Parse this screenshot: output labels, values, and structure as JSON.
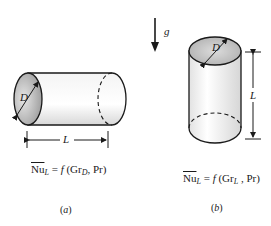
{
  "figure": {
    "panel_a": {
      "description": "Horizontal cylinder",
      "labels": {
        "diameter": "D",
        "length": "L"
      },
      "equation": {
        "lhs_base": "Nu",
        "lhs_sub": "L",
        "eq": " = ",
        "func": "f",
        "open": " (Gr",
        "arg_sub": "D",
        "rest": ", Pr)"
      },
      "caption": {
        "open": "(",
        "letter": "a",
        "close": ")"
      }
    },
    "panel_b": {
      "description": "Vertical cylinder",
      "labels": {
        "gravity": "g",
        "diameter": "D",
        "length": "L"
      },
      "equation": {
        "lhs_base": "Nu",
        "lhs_sub": "L",
        "eq": " = ",
        "func": "f",
        "open": " (Gr",
        "arg_sub": "L",
        "rest": " , Pr)"
      },
      "caption": {
        "open": "(",
        "letter": "b",
        "close": ")"
      }
    }
  }
}
